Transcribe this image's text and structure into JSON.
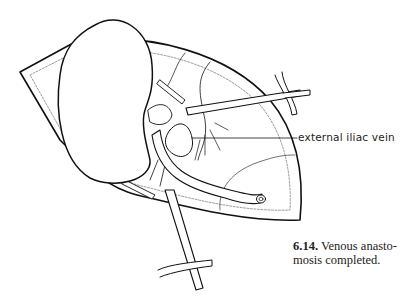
{
  "figure": {
    "label": "external iliac vein",
    "caption_number": "6.14.",
    "caption_text": "Venous anastomosis completed.",
    "caption_line1": "Venous anasto-",
    "caption_line2": "mosis completed."
  }
}
